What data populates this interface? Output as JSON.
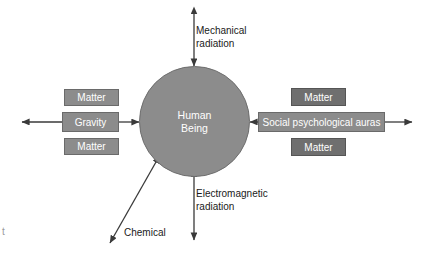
{
  "diagram": {
    "background_color": "#ffffff",
    "node_fill": "#8c8c8c",
    "node_fill_dark": "#6f6f6f",
    "node_text_color": "#ffffff",
    "line_color": "#3a3a3a",
    "center": {
      "label": "Human\nBeing",
      "shape": "circle"
    },
    "boxes": [
      {
        "id": "matter-left-top",
        "label": "Matter",
        "side": "left",
        "tone": "light"
      },
      {
        "id": "gravity",
        "label": "Gravity",
        "side": "left",
        "tone": "light"
      },
      {
        "id": "matter-left-bottom",
        "label": "Matter",
        "side": "left",
        "tone": "light"
      },
      {
        "id": "matter-right-top",
        "label": "Matter",
        "side": "right",
        "tone": "dark"
      },
      {
        "id": "auras",
        "label": "Social psychological auras",
        "side": "right",
        "tone": "light"
      },
      {
        "id": "matter-right-bottom",
        "label": "Matter",
        "side": "right",
        "tone": "dark"
      }
    ],
    "edge_labels": [
      {
        "id": "mechanical",
        "label": "Mechanical\nradiation",
        "direction": "up"
      },
      {
        "id": "electromagnetic",
        "label": "Electromagnetic\nradiation",
        "direction": "down"
      },
      {
        "id": "chemical",
        "label": "Chemical",
        "direction": "down-left"
      }
    ],
    "stray_mark": "t"
  }
}
